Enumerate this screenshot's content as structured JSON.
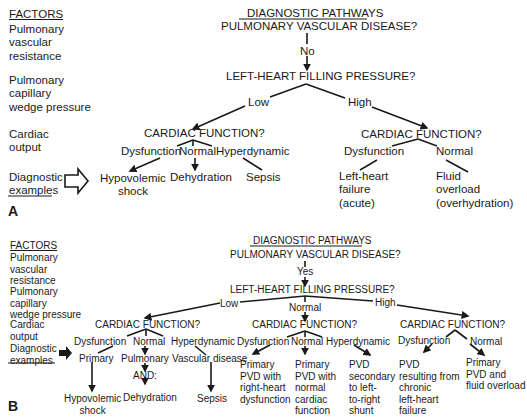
{
  "panel_a": {
    "label": "A",
    "factors": {
      "header": "FACTORS",
      "pvr": "Pulmonary\nvascular\nresistance",
      "pcwp": "Pulmonary\ncapillary\nwedge pressure",
      "co": "Cardiac\noutput",
      "examples": "Diagnostic\nexamples"
    },
    "title": "DIAGNOSTIC PATHWAYS",
    "q_pvd": "PULMONARY VASCULAR DISEASE?",
    "answer_pvd": "No",
    "q_lhfp": "LEFT-HEART FILLING PRESSURE?",
    "branch_low": "Low",
    "branch_high": "High",
    "low_cardiac": {
      "question": "CARDIAC FUNCTION?",
      "dysfunction": "Dysfunction",
      "normal": "Normal",
      "hyperdynamic": "Hyperdynamic",
      "ex_dysfunction": "Hypovolemic\nshock",
      "ex_normal": "Dehydration",
      "ex_hyperdynamic": "Sepsis"
    },
    "high_cardiac": {
      "question": "CARDIAC FUNCTION?",
      "dysfunction": "Dysfunction",
      "normal": "Normal",
      "ex_dysfunction": "Left-heart\nfailure\n(acute)",
      "ex_normal": "Fluid\noverload\n(overhydration)"
    }
  },
  "panel_b": {
    "label": "B",
    "factors": {
      "header": "FACTORS",
      "pvr": "Pulmonary\nvascular\nresistance",
      "pcwp": "Pulmonary\ncapillary\nwedge pressure",
      "co": "Cardiac\noutput",
      "examples": "Diagnostic\nexamples"
    },
    "title": "DIAGNOSTIC PATHWAYS",
    "q_pvd": "PULMONARY VASCULAR DISEASE?",
    "answer_pvd": "Yes",
    "q_lhfp": "LEFT-HEART FILLING PRESSURE?",
    "branch_low": "Low",
    "branch_normal": "Normal",
    "branch_high": "High",
    "low_cardiac": {
      "question": "CARDIAC FUNCTION?",
      "dysfunction": "Dysfunction",
      "normal": "Normal",
      "hyperdynamic": "Hyperdynamic",
      "sub_dysfunction": "Primary",
      "sub_normal": "Pulmonary",
      "sub_normal_and": "AND:",
      "sub_hyperdynamic": "Vascular disease",
      "ex_dysfunction": "Hypovolemic\nshock",
      "ex_normal": "Dehydration",
      "ex_hyperdynamic": "Sepsis"
    },
    "normal_cardiac": {
      "question": "CARDIAC FUNCTION?",
      "dysfunction": "Dysfunction",
      "normal": "Normal",
      "hyperdynamic": "Hyperdynamic",
      "ex_dysfunction": "Primary\nPVD with\nright-heart\ndysfunction",
      "ex_normal": "Primary\nPVD with\nnormal\ncardiac\nfunction",
      "ex_hyperdynamic": "PVD\nsecondary\nto left-\nto-right\nshunt"
    },
    "high_cardiac": {
      "question": "CARDIAC FUNCTION?",
      "dysfunction": "Dysfunction",
      "normal": "Normal",
      "ex_dysfunction": "PVD\nresulting from\nchronic\nleft-heart\nfailure",
      "ex_normal": "Primary\nPVD and\nfluid overload"
    }
  },
  "colors": {
    "ink": "#1a1a1a",
    "background": "#ffffff"
  }
}
